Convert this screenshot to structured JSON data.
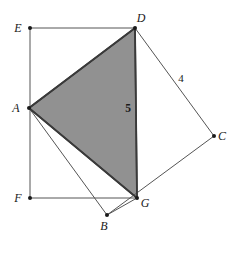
{
  "figure": {
    "background_color": "#ffffff",
    "stroke_color": "#555555",
    "shaded_fill": "#919191",
    "shaded_stroke": "#3a3a3a",
    "vertex_dot_color": "#1a1a1a"
  },
  "points": {
    "E": {
      "label": "E",
      "x": 30,
      "y": 28,
      "label_x": 18,
      "label_y": 32
    },
    "D": {
      "label": "D",
      "x": 135,
      "y": 28,
      "label_x": 141,
      "label_y": 22
    },
    "A": {
      "label": "A",
      "x": 29,
      "y": 108,
      "label_x": 16,
      "label_y": 112
    },
    "C": {
      "label": "C",
      "x": 214,
      "y": 136,
      "label_x": 222,
      "label_y": 140
    },
    "F": {
      "label": "F",
      "x": 30,
      "y": 198,
      "label_x": 18,
      "label_y": 202
    },
    "G": {
      "label": "G",
      "x": 137,
      "y": 198,
      "label_x": 143,
      "label_y": 206
    },
    "B": {
      "label": "B",
      "x": 107,
      "y": 215,
      "label_x": 103,
      "label_y": 229
    }
  },
  "segments": [
    {
      "name": "segment-E-D",
      "from": "E",
      "to": "D",
      "shaded": false
    },
    {
      "name": "segment-E-F",
      "from": "E",
      "to": "F",
      "shaded": false
    },
    {
      "name": "segment-F-G",
      "from": "F",
      "to": "G",
      "shaded": false
    },
    {
      "name": "segment-D-C",
      "from": "D",
      "to": "C",
      "shaded": false
    },
    {
      "name": "segment-C-B",
      "from": "C",
      "to": "B",
      "shaded": false
    },
    {
      "name": "segment-B-A",
      "from": "B",
      "to": "A",
      "shaded": false
    },
    {
      "name": "segment-A-B-to-G",
      "from": "A",
      "to": "G",
      "shaded": false
    },
    {
      "name": "segment-B-G",
      "from": "B",
      "to": "G",
      "shaded": false
    },
    {
      "name": "segment-D-G",
      "from": "D",
      "to": "G",
      "shaded": true
    },
    {
      "name": "segment-A-D",
      "from": "A",
      "to": "D",
      "shaded": true
    }
  ],
  "shaded_region": {
    "name": "triangle-ADG",
    "vertices": [
      "A",
      "D",
      "G"
    ],
    "fill": "#919191"
  },
  "measurements": [
    {
      "id": "len-5",
      "value": "5",
      "x": 128,
      "y": 112,
      "bold": true,
      "on_segment": "D-G"
    },
    {
      "id": "len-4",
      "value": "4",
      "x": 180,
      "y": 82,
      "bold": false,
      "on_segment": "D-C"
    }
  ]
}
